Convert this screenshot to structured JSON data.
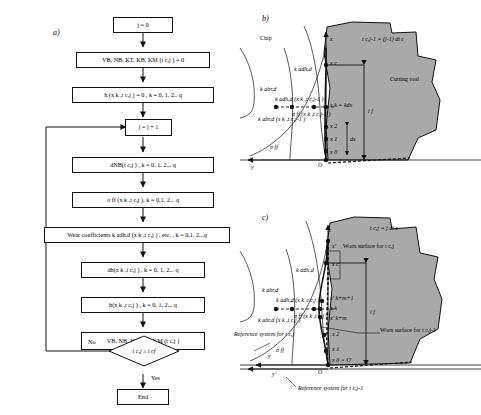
{
  "figure": {
    "panels": [
      {
        "id": "a",
        "label": "a)"
      },
      {
        "id": "b",
        "label": "b)"
      },
      {
        "id": "c",
        "label": "c)"
      }
    ]
  },
  "flowchart": {
    "nodes": [
      {
        "name": "init-j",
        "text": "j = 0"
      },
      {
        "name": "init-wear-measures",
        "text": "VB, NB, KT, KB, KM (t c,j ) = 0"
      },
      {
        "name": "init-h",
        "text": "h (x k ,t c,j ) = 0 ,  k = 0, 1, 2.. q"
      },
      {
        "name": "increment-j",
        "text": "j = j + 1"
      },
      {
        "name": "dnb",
        "text": "dNB(t c,j ) ,  k = 0, 1, 2... q"
      },
      {
        "name": "sigma-ff",
        "text": "σ ff (x k ,t c,j ),  k = 0,1, 2... q"
      },
      {
        "name": "wear-coefficients",
        "text": "Wear coefficients k adh,d (x k ,t c,j ) , etc. ,  k = 0,1, 2...q"
      },
      {
        "name": "dh",
        "text": "dh(x k ,t c,j ) ,  k = 0, 1, 2... q"
      },
      {
        "name": "h",
        "text": "h(x k ,t c,j ) ,  k = 0, 1, 2... q"
      },
      {
        "name": "wear-measures",
        "text": "VB, NB, KT, KB, KM (t c,j )"
      },
      {
        "name": "end",
        "text": "End"
      }
    ],
    "decision": {
      "name": "time-check",
      "text": "t c,j  ≥ t cf"
    },
    "branch_no": "No",
    "branch_yes": "Yes"
  },
  "diagram_b": {
    "panel_label": "b)",
    "chip_label": "Chip",
    "tool_label": "Cutting tool",
    "time_label": "t c,j-1 = (j-1) dt c",
    "axis_x": "x",
    "axis_y": "y",
    "origin": "O",
    "node_label": "x k = kdx",
    "lf_label": "l f",
    "dx_label": "dx",
    "x0": "x 0",
    "x1": "x 1",
    "x2": "x 2",
    "xc": "x c",
    "curve_kadhd": "k adh,d",
    "curve_kabrd": "k abr,d",
    "curve_kadhd_pt": "k adh,d (x k ,t c,j-1 )",
    "curve_kabrd_pt": "k abr,d (x k ,t c,j-1 )",
    "curve_sigmaff_pt": "σ ff (x k ,t c,j-1 )",
    "sigma_ff": "σ ff"
  },
  "diagram_c": {
    "panel_label": "c)",
    "time_label": "t c,j = j dt c",
    "worn_surface_current": "Worn surface for t c,j",
    "worn_surface_previous": "Worn surface for t c,j-1",
    "reference_current": "Reference system for t c,j",
    "reference_previous": "Reference system for t c,j-1",
    "axis_x": "x",
    "axis_x_prime": "x'",
    "axis_y": "y",
    "axis_y_prime": "y'",
    "origin": "O",
    "origin_prime": "O'",
    "x0_origin": "x 0 = O'",
    "x1": "x 1",
    "x2": "x 2",
    "xc": "x c",
    "xk": "x k",
    "xk_m": "x' k+m",
    "xk_m1": "x' k+m+1",
    "lf_label": "l f",
    "curve_kadhd": "k adh,d",
    "curve_kabrd": "k abr,d",
    "curve_kadhd_pt": "k adh,d (x k ,t c,j )",
    "curve_kabrd_pt": "k abr,d (x k ,t c,j )",
    "curve_sigmaff_pt": "σ ff (x k ,t c,j )",
    "sigma_ff": "σ ff"
  },
  "colors": {
    "tool_fill": "#a9a9a9",
    "line": "#111111",
    "background": "#ffffff"
  }
}
